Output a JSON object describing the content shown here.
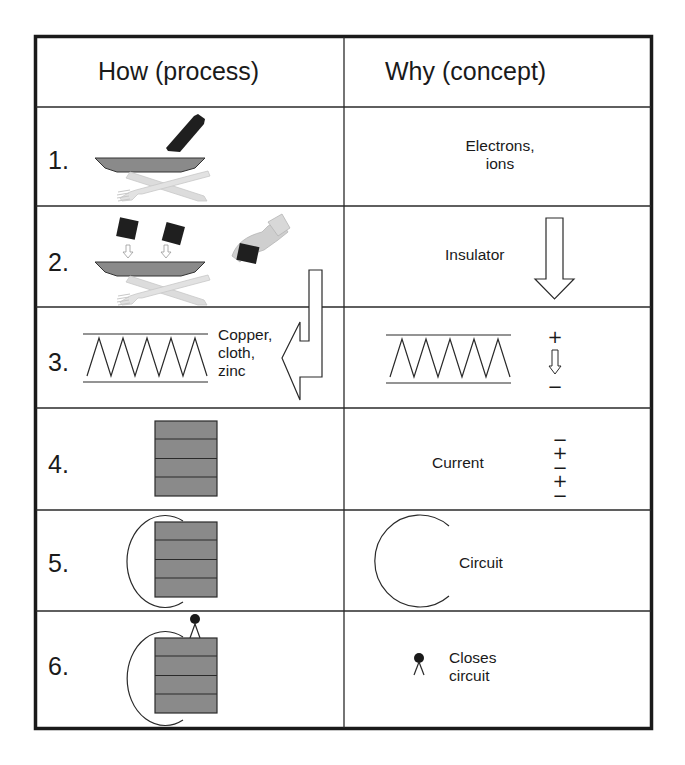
{
  "table": {
    "headers": {
      "how": "How (process)",
      "why": "Why (concept)"
    },
    "rows": [
      {
        "number": "1.",
        "how_figure": "plate-and-cutlery-with-bottle-pouring",
        "why_label": "Electrons,\nions"
      },
      {
        "number": "2.",
        "how_figure": "plates-being-stacked-by-hand",
        "why_label": "Insulator",
        "why_figure": "down-arrow"
      },
      {
        "number": "3.",
        "how_figure": "zigzag-pile",
        "how_label": "Copper,\ncloth,\nzinc",
        "why_figure": "zigzag-pile-with-polarity",
        "why_symbols": {
          "top": "+",
          "bottom": "−"
        }
      },
      {
        "number": "4.",
        "how_figure": "stacked-battery-cells",
        "why_label": "Current",
        "why_symbols": [
          "−",
          "+",
          "−",
          "+",
          "−"
        ]
      },
      {
        "number": "5.",
        "how_figure": "battery-with-wire-arc",
        "why_label": "Circuit",
        "why_figure": "open-arc"
      },
      {
        "number": "6.",
        "how_figure": "battery-with-wire-and-contact",
        "why_label": "Closes\ncircuit",
        "why_figure": "contact-pin"
      }
    ]
  },
  "colors": {
    "border": "#1a1a1a",
    "cell_fill": "#8a8a8a",
    "cutlery": "#d9d9d9",
    "dark": "#1a1a1a"
  }
}
